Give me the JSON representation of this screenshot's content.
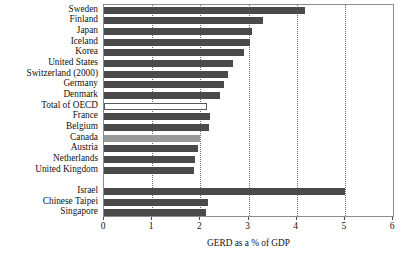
{
  "chart_data": {
    "type": "bar",
    "orientation": "horizontal",
    "title": "",
    "xlabel": "GERD as a % of GDP",
    "ylabel": "",
    "xlim": [
      0,
      6
    ],
    "xticks": [
      0,
      1,
      2,
      3,
      4,
      5,
      6
    ],
    "xtick_labels": [
      "0",
      "1",
      "2",
      "3",
      "4",
      "5",
      "6"
    ],
    "grid": "vertical-dotted",
    "legend": null,
    "groups": [
      {
        "name": "oecd-group",
        "categories": [
          "Sweden",
          "Finland",
          "Japan",
          "Iceland",
          "Korea",
          "United States",
          "Switzerland (2000)",
          "Germany",
          "Denmark",
          "Total of OECD",
          "France",
          "Belgium",
          "Canada",
          "Austria",
          "Netherlands",
          "United Kingdom"
        ],
        "values": [
          4.17,
          3.31,
          3.07,
          3.04,
          2.91,
          2.67,
          2.57,
          2.49,
          2.4,
          2.13,
          2.2,
          2.17,
          1.99,
          1.95,
          1.89,
          1.87
        ],
        "styles": [
          "dark",
          "dark",
          "dark",
          "dark",
          "dark",
          "dark",
          "dark",
          "dark",
          "dark",
          "hollow",
          "dark",
          "dark",
          "light",
          "dark",
          "dark",
          "dark"
        ]
      },
      {
        "name": "non-oecd-group",
        "categories": [
          "Israel",
          "Chinese Taipei",
          "Singapore"
        ],
        "values": [
          5.0,
          2.16,
          2.11
        ],
        "styles": [
          "dark",
          "dark",
          "dark"
        ]
      }
    ]
  },
  "colors": {
    "bar_dark": "#4a4a4a",
    "bar_light": "#9a9a9a",
    "bar_hollow_fill": "#ffffff",
    "bar_hollow_border": "#5a5a5a",
    "gridline": "#6d6d6d",
    "axis": "#8c8c8c",
    "text": "#111111",
    "background": "#ffffff"
  }
}
